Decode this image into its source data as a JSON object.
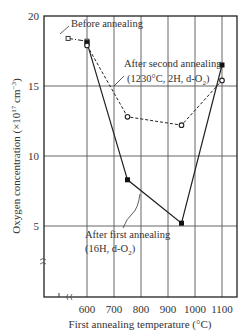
{
  "chart_data": {
    "type": "line",
    "title": "",
    "xlabel": "First annealing temperature (°C)",
    "ylabel": "Oxygen concentration (×10¹⁷ cm⁻³)",
    "ylabel_parts": {
      "main": "Oxygen concentration (×10",
      "sup1": "17",
      "mid": " cm",
      "sup2": "−3",
      "end": ")"
    },
    "xlim": [
      500,
      1150
    ],
    "ylim": [
      0,
      20
    ],
    "y_axis_break": true,
    "x_axis_break": true,
    "xticks": [
      600,
      700,
      800,
      900,
      1000,
      1100
    ],
    "xtick_labels": [
      "600",
      "700",
      "800",
      "900",
      "1000",
      "1100"
    ],
    "yticks": [
      5,
      10,
      15,
      20
    ],
    "ytick_labels": [
      "5",
      "10",
      "15",
      "20"
    ],
    "grid": true,
    "series": [
      {
        "name": "Before annealing",
        "marker": "open-square",
        "line": "dash-dot",
        "points": [
          {
            "x": 530,
            "y": 18.4
          },
          {
            "x": 600,
            "y": 18.2
          }
        ]
      },
      {
        "name": "After first annealing (16H, d-O2)",
        "marker": "filled-square",
        "line": "solid",
        "points": [
          {
            "x": 600,
            "y": 18.1
          },
          {
            "x": 750,
            "y": 8.3
          },
          {
            "x": 950,
            "y": 5.2
          },
          {
            "x": 1100,
            "y": 16.5
          }
        ]
      },
      {
        "name": "After second annealing (1230°C, 2H, d-O2)",
        "marker": "open-circle",
        "line": "dashed",
        "points": [
          {
            "x": 600,
            "y": 17.9
          },
          {
            "x": 750,
            "y": 12.8
          },
          {
            "x": 950,
            "y": 12.2
          },
          {
            "x": 1100,
            "y": 15.4
          }
        ]
      }
    ],
    "annotations": [
      {
        "text": "Before annealing"
      },
      {
        "text": "After second annealing",
        "line2": "(1230°C, 2H, d-O",
        "sub": "2",
        "end": ")"
      },
      {
        "text": "After first annealing",
        "line2": "(16H, d-O",
        "sub": "2",
        "end": ")"
      }
    ]
  }
}
